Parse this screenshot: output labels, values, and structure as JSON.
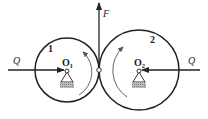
{
  "diagram": {
    "labels": {
      "force_left": "Q",
      "force_right": "Q",
      "force_up": "F",
      "gear1": "1",
      "gear2": "2",
      "pivot1_base": "O",
      "pivot1_sub": "1",
      "pivot2_base": "O",
      "pivot2_sub": "2"
    },
    "colors": {
      "stroke": "#222222",
      "rotation_arrow": "#555555",
      "ground_hatch": "#9a9a9a"
    }
  }
}
